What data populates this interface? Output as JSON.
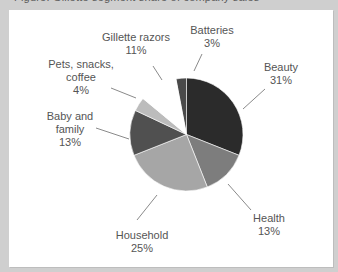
{
  "caption": "Figure: Gillette segment share of company sales",
  "chart_data": {
    "type": "pie",
    "title": "",
    "start_angle_deg": -10.8,
    "direction": "clockwise",
    "slices": [
      {
        "label": "Batteries",
        "value": 3,
        "pct_text": "3%",
        "color": "#4a4a4a"
      },
      {
        "label": "Beauty",
        "value": 31,
        "pct_text": "31%",
        "color": "#2b2b2b"
      },
      {
        "label": "Health",
        "value": 13,
        "pct_text": "13%",
        "color": "#7d7d7d"
      },
      {
        "label": "Household",
        "value": 25,
        "pct_text": "25%",
        "color": "#a6a6a6"
      },
      {
        "label": "Baby and family",
        "value": 13,
        "pct_text": "13%",
        "color": "#505050"
      },
      {
        "label": "Pets, snacks, coffee",
        "value": 4,
        "pct_text": "4%",
        "color": "#bcbcbc"
      },
      {
        "label": "Gillette razors",
        "value": 11,
        "pct_text": "11%",
        "color": "#ffffff"
      }
    ],
    "categories": [
      "Batteries",
      "Beauty",
      "Health",
      "Household",
      "Baby and family",
      "Pets, snacks, coffee",
      "Gillette razors"
    ],
    "values": [
      3,
      31,
      13,
      25,
      13,
      4,
      11
    ],
    "legend": "none (direct labels with leader lines)"
  },
  "labels": {
    "gillette": {
      "line1": "Gillette razors",
      "line2": "11%"
    },
    "batteries": {
      "line1": "Batteries",
      "line2": "3%"
    },
    "beauty": {
      "line1": "Beauty",
      "line2": "31%"
    },
    "pets": {
      "line1": "Pets, snacks,",
      "line2": "coffee",
      "line3": "4%"
    },
    "baby": {
      "line1": "Baby and",
      "line2": "family",
      "line3": "13%"
    },
    "health": {
      "line1": "Health",
      "line2": "13%"
    },
    "household": {
      "line1": "Household",
      "line2": "25%"
    }
  }
}
